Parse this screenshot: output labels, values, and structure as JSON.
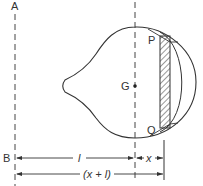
{
  "diagram": {
    "labels": {
      "axis_top": "A",
      "axis_bottom": "B",
      "centroid": "G",
      "point_top": "P",
      "point_bottom": "Q",
      "dim_l": "l",
      "dim_x": "x",
      "dim_total": "(x + l)"
    },
    "colors": {
      "stroke": "#333333",
      "background": "#ffffff"
    }
  }
}
